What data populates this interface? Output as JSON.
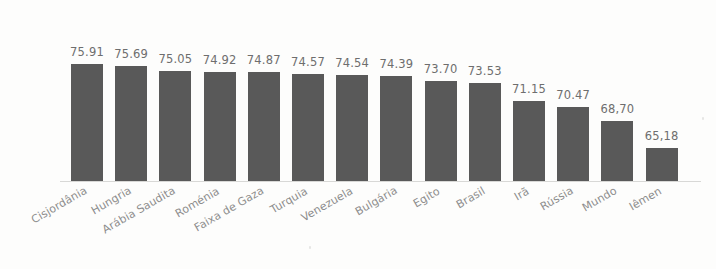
{
  "chart_data": {
    "type": "bar",
    "title": "",
    "subtitle": "",
    "xlabel": "",
    "ylabel": "",
    "grid": false,
    "legend": null,
    "axis_baseline_value": 61.0,
    "ylim": [
      61.0,
      77.4
    ],
    "value_label_format": "2 decimals, comma decimal separator on some labels",
    "categories": [
      "Cisjordânia",
      "Hungria",
      "Arábia Saudita",
      "Roménia",
      "Faixa de Gaza",
      "Turquia",
      "Venezuela",
      "Bulgária",
      "Egito",
      "Brasil",
      "Irã",
      "Rússia",
      "Mundo",
      "Iêmen"
    ],
    "values": [
      75.91,
      75.69,
      75.05,
      74.92,
      74.87,
      74.57,
      74.54,
      74.39,
      73.7,
      73.53,
      71.15,
      70.47,
      68.7,
      65.18
    ],
    "value_labels": [
      "75.91",
      "75.69",
      "75.05",
      "74.92",
      "74.87",
      "74.57",
      "74.54",
      "74.39",
      "73.70",
      "73.53",
      "71.15",
      "70.47",
      "68,70",
      "65,18"
    ],
    "bar_color": "#595959",
    "label_color": "#6e6e6e",
    "category_label_color": "#8d8d8d",
    "background_color": "#fdfdfc",
    "axis_color": "#d8d8d6"
  }
}
